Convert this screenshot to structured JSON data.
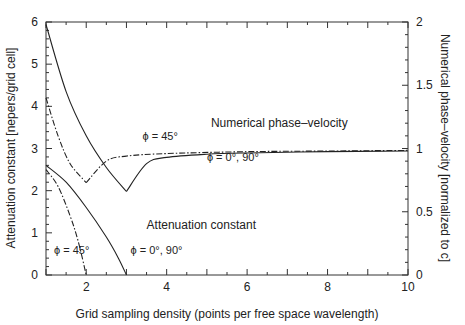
{
  "chart_data": {
    "type": "line",
    "title": "",
    "xlabel": "Grid sampling density (points per free space wavelength)",
    "ylabel": "Attenuation constant [nepers/grid cell]",
    "ylabel_right": "Numerical phase–velocity [normalized to c]",
    "xlim": [
      1,
      10
    ],
    "ylim": [
      0,
      6
    ],
    "ylim_right": [
      0,
      2
    ],
    "xticks": [
      "2",
      "4",
      "6",
      "8",
      "10"
    ],
    "yticks": [
      "0",
      "1",
      "2",
      "3",
      "4",
      "5",
      "6"
    ],
    "yticks_right": [
      "0",
      "0.5",
      "1",
      "1.5",
      "2"
    ],
    "grid": false,
    "annotations": [
      {
        "text": "Numerical phase–velocity",
        "x": 5.1,
        "y": 3.5
      },
      {
        "text": "ϕ = 45°",
        "x": 3.4,
        "y": 3.2
      },
      {
        "text": "ϕ = 0°, 90°",
        "x": 5.0,
        "y": 2.7
      },
      {
        "text": "Attenuation constant",
        "x": 3.5,
        "y": 1.1
      },
      {
        "text": "ϕ = 45°",
        "x": 1.2,
        "y": 0.5
      },
      {
        "text": "ϕ = 0°, 90°",
        "x": 3.1,
        "y": 0.5
      }
    ],
    "series": [
      {
        "name": "Attenuation constant, ϕ = 0°, 90°",
        "style": "solid",
        "axis": "left",
        "x": [
          1.0,
          1.5,
          2.0,
          2.5,
          2.8,
          3.0
        ],
        "y": [
          2.6,
          2.2,
          1.6,
          0.9,
          0.4,
          0.0
        ]
      },
      {
        "name": "Attenuation constant, ϕ = 45°",
        "style": "dash-dot",
        "axis": "left",
        "x": [
          1.0,
          1.3,
          1.6,
          1.8,
          2.0
        ],
        "y": [
          2.5,
          2.1,
          1.4,
          0.8,
          0.0
        ]
      },
      {
        "name": "Numerical phase-velocity, ϕ = 0°, 90°",
        "style": "solid",
        "axis": "right",
        "x": [
          1.0,
          1.5,
          2.0,
          2.5,
          3.0,
          3.5,
          4.0,
          5.0,
          6.0,
          8.0,
          10.0
        ],
        "y": [
          1.98,
          1.45,
          1.1,
          0.85,
          0.66,
          0.88,
          0.93,
          0.955,
          0.965,
          0.975,
          0.98
        ]
      },
      {
        "name": "Numerical phase-velocity, ϕ = 45°",
        "style": "dash-dot",
        "axis": "right",
        "x": [
          1.0,
          1.3,
          1.6,
          2.0,
          2.5,
          3.0,
          4.0,
          6.0,
          8.0,
          10.0
        ],
        "y": [
          1.4,
          1.1,
          0.88,
          0.73,
          0.9,
          0.94,
          0.96,
          0.975,
          0.98,
          0.985
        ]
      }
    ]
  }
}
